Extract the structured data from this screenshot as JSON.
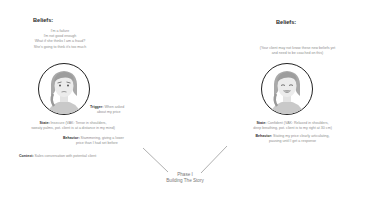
{
  "left_panel": {
    "beliefs_heading": "Beliefs:",
    "beliefs": [
      "I'm a failure",
      "I'm not good enough",
      "What if she thinks I am a fraud?",
      "She's going to think it's too much"
    ],
    "avatar": "worried-woman-avatar",
    "trigger_label": "Trigger:",
    "trigger_text_1": "When asked",
    "trigger_text_2": "about my price",
    "state_label": "State:",
    "state_text_1": "Insecure (VAK: Tense in shoulders,",
    "state_text_2": "sweaty palms, pot. client is at a distance in my mind)",
    "behavior_label": "Behavior:",
    "behavior_text_1": "Stammering, giving a lower",
    "behavior_text_2": "price than I had set before",
    "context_label": "Context:",
    "context_text": "Sales conversation with potential client"
  },
  "right_panel": {
    "beliefs_heading": "Beliefs:",
    "beliefs_note_1": "(Your client may not know these new beliefs yet",
    "beliefs_note_2": "and need to be coached on this)",
    "avatar": "smiling-woman-avatar",
    "state_label": "State:",
    "state_text_1": "Confident (VAK: Relaxed in shoulders,",
    "state_text_2": "deep breathing, pot. client is to my right at 30 cm)",
    "behavior_label": "Behavior:",
    "behavior_text_1": "Stating my price clearly articulating,",
    "behavior_text_2": "pausing until I get a response"
  },
  "phase": {
    "line_1": "Phase I",
    "line_2": "Building The Story"
  },
  "colors": {
    "heading": "#2a2a2a",
    "body_text": "#8e8e8e",
    "label_text": "#333333",
    "line": "#9a9a9a",
    "circle_border": "#222222"
  }
}
